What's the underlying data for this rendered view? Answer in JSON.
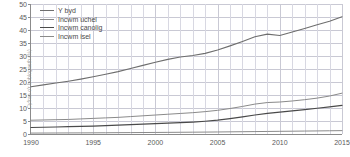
{
  "chart_data": {
    "type": "line",
    "title": "",
    "xlabel": "",
    "ylabel": "Cyfran o'r boblogaeth (%)",
    "xlim": [
      1990,
      2015
    ],
    "ylim": [
      0,
      50
    ],
    "ygrid": true,
    "xgrid": true,
    "legend_position": "top-left",
    "xticks": [
      "1990",
      "1995",
      "2000",
      "2005",
      "2010",
      "2015"
    ],
    "xtick_values": [
      1990,
      1995,
      2000,
      2005,
      2010,
      2015
    ],
    "yticks": [
      "0",
      "5",
      "10",
      "15",
      "20",
      "25",
      "30",
      "35",
      "40",
      "45",
      "50"
    ],
    "ytick_values": [
      0,
      5,
      10,
      15,
      20,
      25,
      30,
      35,
      40,
      45,
      50
    ],
    "x": [
      1990,
      1991,
      1992,
      1993,
      1994,
      1995,
      1996,
      1997,
      1998,
      1999,
      2000,
      2001,
      2002,
      2003,
      2004,
      2005,
      2006,
      2007,
      2008,
      2009,
      2010,
      2011,
      2012,
      2013,
      2014,
      2015
    ],
    "series": [
      {
        "name": "Y byd",
        "color": "#6e6e6e",
        "width": 1.1,
        "values": [
          18.2,
          18.9,
          19.6,
          20.3,
          21.1,
          22.0,
          23.0,
          24.0,
          25.2,
          26.4,
          27.6,
          28.7,
          29.6,
          30.2,
          31.0,
          32.3,
          33.9,
          35.6,
          37.4,
          38.4,
          37.9,
          39.2,
          40.6,
          42.0,
          43.4,
          45.1
        ]
      },
      {
        "name": "Incwm uchel",
        "color": "#8a8a8a",
        "width": 1.0,
        "values": [
          5.3,
          5.4,
          5.5,
          5.6,
          5.8,
          6.0,
          6.2,
          6.4,
          6.7,
          7.0,
          7.3,
          7.6,
          7.9,
          8.2,
          8.6,
          9.1,
          9.8,
          10.6,
          11.5,
          12.1,
          12.3,
          12.7,
          13.2,
          13.8,
          14.6,
          15.7
        ]
      },
      {
        "name": "Incwm canolig",
        "color": "#4a4a4a",
        "width": 1.2,
        "values": [
          2.5,
          2.6,
          2.7,
          2.8,
          2.9,
          3.0,
          3.2,
          3.4,
          3.6,
          3.8,
          4.0,
          4.2,
          4.4,
          4.6,
          4.9,
          5.3,
          5.9,
          6.6,
          7.3,
          7.9,
          8.4,
          8.9,
          9.4,
          9.9,
          10.4,
          11.0
        ]
      },
      {
        "name": "Incwm isel",
        "color": "#8a8a8a",
        "width": 1.0,
        "values": [
          0.35,
          0.37,
          0.39,
          0.41,
          0.43,
          0.45,
          0.48,
          0.51,
          0.54,
          0.57,
          0.6,
          0.63,
          0.66,
          0.7,
          0.74,
          0.78,
          0.83,
          0.88,
          0.93,
          0.98,
          1.03,
          1.08,
          1.13,
          1.18,
          1.24,
          1.3
        ]
      }
    ]
  }
}
